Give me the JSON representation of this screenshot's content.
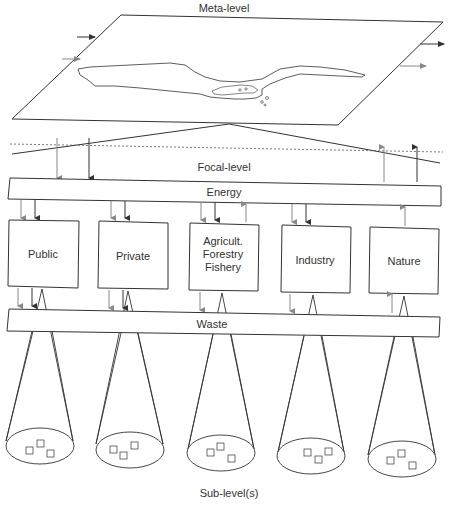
{
  "diagram": {
    "levels": {
      "meta": "Meta-level",
      "focal": "Focal-level",
      "sub": "Sub-level(s)"
    },
    "bars": {
      "energy": "Energy",
      "waste": "Waste"
    },
    "sectors": [
      {
        "label_lines": [
          "Public"
        ]
      },
      {
        "label_lines": [
          "Private"
        ]
      },
      {
        "label_lines": [
          "Agricult.",
          "Forestry",
          "Fishery"
        ]
      },
      {
        "label_lines": [
          "Industry"
        ]
      },
      {
        "label_lines": [
          "Nature"
        ]
      }
    ],
    "colors": {
      "line": "#333333",
      "arrow_dark": "#333333",
      "arrow_light": "#888888",
      "background": "#ffffff"
    }
  }
}
